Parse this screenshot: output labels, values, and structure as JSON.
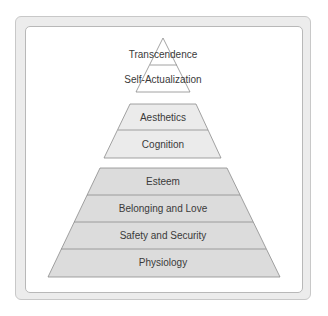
{
  "diagram": {
    "type": "pyramid",
    "colors": {
      "top_fill": "#ffffff",
      "middle_fill": "#ebebeb",
      "bottom_fill": "#dcdcdc",
      "stroke": "#8c8c8c",
      "text": "#3a3a3a"
    },
    "groups": [
      {
        "name": "top",
        "levels": [
          {
            "label": "Transcendence"
          },
          {
            "label": "Self-Actualization"
          }
        ]
      },
      {
        "name": "middle",
        "levels": [
          {
            "label": "Aesthetics"
          },
          {
            "label": "Cognition"
          }
        ]
      },
      {
        "name": "bottom",
        "levels": [
          {
            "label": "Esteem"
          },
          {
            "label": "Belonging and Love"
          },
          {
            "label": "Safety and Security"
          },
          {
            "label": "Physiology"
          }
        ]
      }
    ]
  }
}
